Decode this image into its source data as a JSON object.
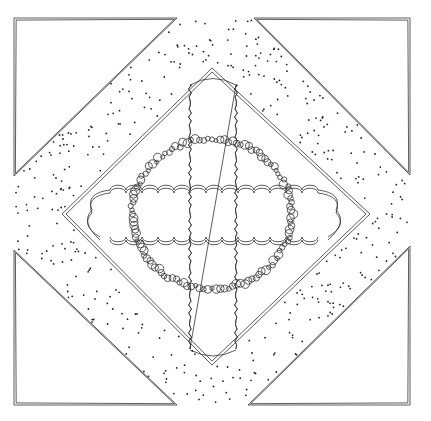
{
  "image": {
    "kind": "quilt-block-line-drawing",
    "width": 431,
    "height": 421,
    "background": "#ffffff",
    "stroke": "#333333"
  },
  "block": {
    "outer_square": {
      "x1": 14,
      "y1": 18,
      "x2": 410,
      "y2": 405
    },
    "corner_triangles": [
      {
        "name": "top-left",
        "points": [
          [
            14,
            18
          ],
          [
            177,
            18
          ],
          [
            14,
            176
          ]
        ]
      },
      {
        "name": "top-right",
        "points": [
          [
            254,
            18
          ],
          [
            410,
            18
          ],
          [
            410,
            175
          ]
        ]
      },
      {
        "name": "bottom-left",
        "points": [
          [
            14,
            250
          ],
          [
            14,
            405
          ],
          [
            177,
            405
          ]
        ]
      },
      {
        "name": "bottom-right",
        "points": [
          [
            248,
            405
          ],
          [
            410,
            405
          ],
          [
            410,
            246
          ]
        ]
      }
    ],
    "inner_diamond": {
      "top": [
        212,
        68
      ],
      "right": [
        370,
        214
      ],
      "bottom": [
        212,
        365
      ],
      "left": [
        62,
        214
      ]
    },
    "dotted_band": "stippled region between corner triangles and inner diamond",
    "center_motif": {
      "description": "wreath of beaded circles with a horizontal scalloped cloud band and a vertical wavy strip crossing it",
      "wreath_center": [
        212,
        214
      ],
      "wreath_rx": 80,
      "wreath_ry": 75
    }
  }
}
